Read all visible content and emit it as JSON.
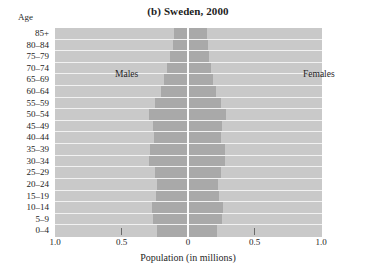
{
  "chart_data": {
    "type": "bar",
    "subtype": "population-pyramid",
    "title": "(b) Sweden, 2000",
    "xlabel": "Population (in millions)",
    "ylabel": "Age",
    "grid": false,
    "legend_position": "inside-top",
    "xlim": [
      -1.0,
      1.0
    ],
    "xtick_labels": [
      "1.0",
      "0.5",
      "0",
      "0.5",
      "1.0"
    ],
    "xtick_values": [
      -1.0,
      -0.5,
      0,
      0.5,
      1.0
    ],
    "categories": [
      "85+",
      "80–84",
      "75–79",
      "70–74",
      "65–69",
      "60–64",
      "55–59",
      "50–54",
      "45–49",
      "40–44",
      "35–39",
      "30–34",
      "25–29",
      "20–24",
      "15–19",
      "10–14",
      "5–9",
      "0–4"
    ],
    "series": [
      {
        "name": "Males",
        "side": "left",
        "color": "#a9a9a9",
        "values": [
          0.105,
          0.115,
          0.135,
          0.16,
          0.18,
          0.205,
          0.245,
          0.29,
          0.26,
          0.255,
          0.285,
          0.29,
          0.25,
          0.235,
          0.24,
          0.27,
          0.265,
          0.23
        ]
      },
      {
        "name": "Females",
        "side": "right",
        "color": "#a9a9a9",
        "values": [
          0.145,
          0.15,
          0.155,
          0.175,
          0.185,
          0.21,
          0.25,
          0.285,
          0.255,
          0.25,
          0.275,
          0.28,
          0.245,
          0.225,
          0.23,
          0.26,
          0.255,
          0.22
        ]
      }
    ]
  },
  "legend": {
    "males_label": "Males",
    "females_label": "Females"
  },
  "axis": {
    "age_label": "Age"
  },
  "colors": {
    "plot_background": "#c9c9c9",
    "bar": "#a9a9a9",
    "gridline": "#f2f2f2",
    "center_line": "#fdfdfd"
  }
}
